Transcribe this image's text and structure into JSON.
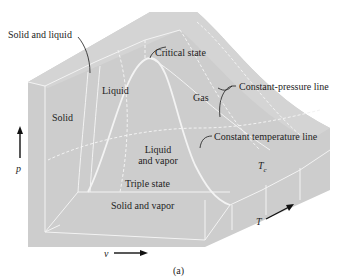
{
  "figure": {
    "caption": "(a)"
  },
  "labels": {
    "solid_and_liquid": "Solid and liquid",
    "critical_state": "Critical state",
    "liquid": "Liquid",
    "gas": "Gas",
    "constant_pressure_line": "Constant-pressure line",
    "solid": "Solid",
    "liquid_and_vapor_1": "Liquid",
    "liquid_and_vapor_2": "and vapor",
    "constant_temperature_line": "Constant temperature line",
    "tc": "T",
    "tc_sub": "c",
    "triple_state": "Triple state",
    "solid_and_vapor": "Solid and vapor"
  },
  "axes": {
    "p": "p",
    "v": "v",
    "T": "T"
  },
  "colors": {
    "surface": "#cfcfcf",
    "surface_light": "#d6d6d6",
    "lines": "#f4f4f4",
    "text": "#1e1e1e"
  }
}
